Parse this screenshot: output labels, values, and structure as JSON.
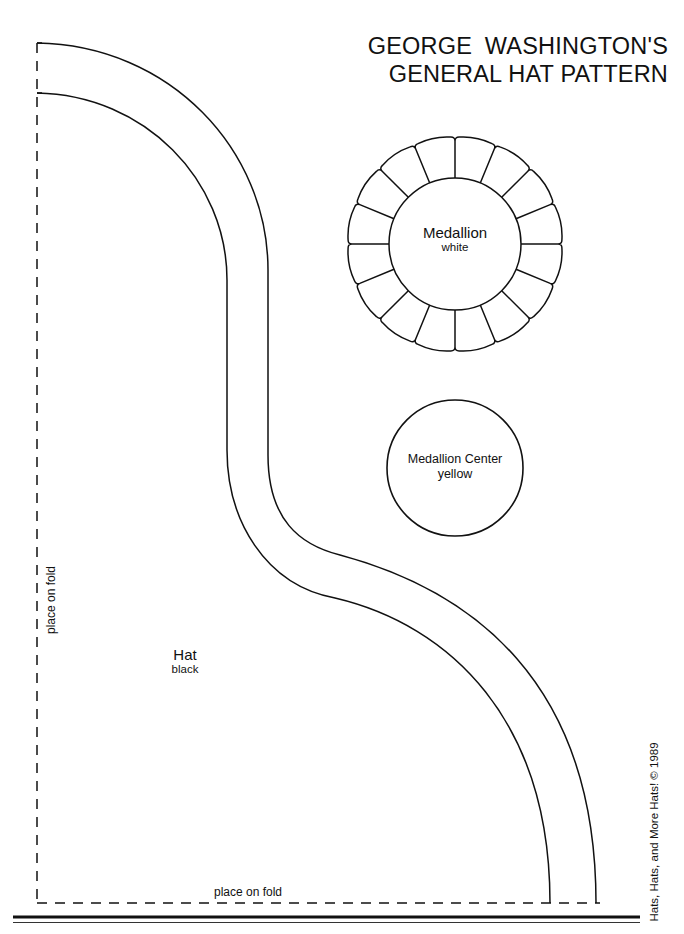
{
  "title": {
    "line1": "GEORGE  WASHINGTON'S",
    "line2": "GENERAL HAT PATTERN"
  },
  "pieces": {
    "medallion": {
      "name": "Medallion",
      "color_label": "white",
      "petal_count": 16
    },
    "medallion_center": {
      "name": "Medallion Center",
      "color_label": "yellow"
    },
    "hat": {
      "name": "Hat",
      "color_label": "black"
    }
  },
  "fold_labels": {
    "left": "place on fold",
    "bottom": "place on fold"
  },
  "copyright": "Hats, Hats, and More Hats! © 1989",
  "colors": {
    "ink": "#111111",
    "paper": "#ffffff"
  }
}
